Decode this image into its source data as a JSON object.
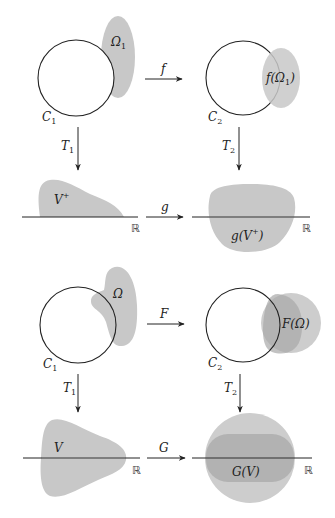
{
  "colors": {
    "shade_light": "#c8c8c8",
    "shade_mid": "#b4b4b4",
    "shade_dark": "#a0a0a0",
    "stroke": "#222222",
    "background": "#ffffff"
  },
  "top_diagram": {
    "left_circle_label": "C",
    "left_circle_sub": "1",
    "region_label": "Ω",
    "region_sub": "1",
    "map_top": "f",
    "right_circle_label": "C",
    "right_circle_sub": "2",
    "image_region_label": "f(Ω",
    "image_region_sub": "1",
    "image_region_close": ")",
    "map_left_down": "T",
    "map_left_down_sub": "1",
    "map_right_down": "T",
    "map_right_down_sub": "2",
    "half_plane_label": "V",
    "half_plane_sup": "+",
    "map_bottom": "g",
    "real_line_left": "ℝ",
    "real_line_right": "ℝ",
    "image_half_label": "g(V",
    "image_half_sup": "+",
    "image_half_close": ")"
  },
  "bottom_diagram": {
    "left_circle_label": "C",
    "left_circle_sub": "1",
    "region_label": "Ω",
    "map_top": "F",
    "right_circle_label": "C",
    "right_circle_sub": "2",
    "image_region_label": "F(Ω)",
    "map_left_down": "T",
    "map_left_down_sub": "1",
    "map_right_down": "T",
    "map_right_down_sub": "2",
    "plane_label": "V",
    "map_bottom": "G",
    "real_line_left": "ℝ",
    "real_line_right": "ℝ",
    "image_plane_label": "G(V)"
  }
}
